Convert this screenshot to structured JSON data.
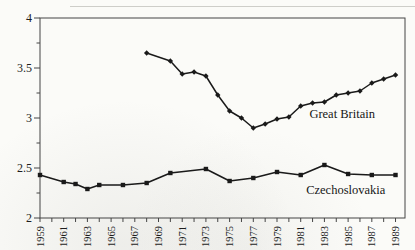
{
  "colors": {
    "ink": "#1a1a1a",
    "frame": "#454545",
    "tick": "#454545",
    "background": "#fbfbf8",
    "scan_artifact": "#c6c6c1"
  },
  "chart_data": {
    "type": "line",
    "title": "",
    "xlabel": "",
    "ylabel": "",
    "grid": false,
    "legend_position": "inline-annotations",
    "xlim": [
      1959,
      1989.8
    ],
    "ylim": [
      2,
      4
    ],
    "y_major_ticks": [
      2,
      2.5,
      3,
      3.5,
      4
    ],
    "y_tick_labels": [
      "2",
      "2.5",
      "3",
      "3.5",
      "4"
    ],
    "y_minor_ticks": [
      2.25,
      2.75,
      3.25,
      3.75
    ],
    "x_tick_years": [
      1959,
      1960,
      1961,
      1962,
      1963,
      1964,
      1965,
      1966,
      1967,
      1968,
      1969,
      1970,
      1971,
      1972,
      1973,
      1974,
      1975,
      1976,
      1977,
      1978,
      1979,
      1980,
      1981,
      1982,
      1983,
      1984,
      1985,
      1986,
      1987,
      1988,
      1989
    ],
    "x_labels": [
      {
        "year": 1959,
        "text": "1959"
      },
      {
        "year": 1961,
        "text": "1961"
      },
      {
        "year": 1963,
        "text": "1963"
      },
      {
        "year": 1965,
        "text": "1965"
      },
      {
        "year": 1967,
        "text": "1967"
      },
      {
        "year": 1969,
        "text": "1969"
      },
      {
        "year": 1971,
        "text": "1971"
      },
      {
        "year": 1973,
        "text": "1973"
      },
      {
        "year": 1975,
        "text": "1975"
      },
      {
        "year": 1977,
        "text": "1977"
      },
      {
        "year": 1979,
        "text": "1979"
      },
      {
        "year": 1981,
        "text": "1981"
      },
      {
        "year": 1983,
        "text": "1983"
      },
      {
        "year": 1985,
        "text": "1985"
      },
      {
        "year": 1987,
        "text": "1987"
      },
      {
        "year": 1989,
        "text": "1989"
      }
    ],
    "series": [
      {
        "name": "Great Britain",
        "marker": "diamond",
        "x": [
          1968,
          1970,
          1971,
          1972,
          1973,
          1974,
          1975,
          1976,
          1977,
          1978,
          1979,
          1980,
          1981,
          1982,
          1983,
          1984,
          1985,
          1986,
          1987,
          1988,
          1989
        ],
        "y": [
          3.65,
          3.57,
          3.44,
          3.46,
          3.42,
          3.23,
          3.07,
          3.0,
          2.9,
          2.94,
          2.99,
          3.01,
          3.12,
          3.15,
          3.16,
          3.23,
          3.25,
          3.27,
          3.35,
          3.39,
          3.43
        ]
      },
      {
        "name": "Czechoslovakia",
        "marker": "square",
        "x": [
          1959,
          1961,
          1962,
          1963,
          1964,
          1966,
          1968,
          1970,
          1973,
          1975,
          1977,
          1979,
          1981,
          1983,
          1985,
          1987,
          1989
        ],
        "y": [
          2.43,
          2.36,
          2.34,
          2.29,
          2.33,
          2.33,
          2.35,
          2.45,
          2.49,
          2.37,
          2.4,
          2.46,
          2.43,
          2.53,
          2.44,
          2.43,
          2.43
        ]
      }
    ],
    "annotations": [
      {
        "text": "Great Britain",
        "x": 1984.5,
        "y": 3.04
      },
      {
        "text": "Czechoslovakia",
        "x": 1984.8,
        "y": 2.28
      }
    ]
  }
}
